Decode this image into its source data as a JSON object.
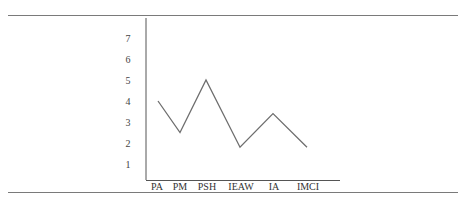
{
  "chart_data": {
    "type": "line",
    "title": "",
    "xlabel": "",
    "ylabel": "",
    "categories": [
      "PA",
      "PM",
      "PSH",
      "IEAW",
      "IA",
      "IMCI"
    ],
    "values": [
      4.0,
      2.5,
      5.0,
      1.8,
      3.4,
      1.8
    ],
    "yticks": [
      1,
      2,
      3,
      4,
      5,
      6,
      7
    ],
    "ylim": [
      0,
      7.5
    ],
    "grid": false,
    "legend": null,
    "line_color": "#6e6e6e"
  }
}
